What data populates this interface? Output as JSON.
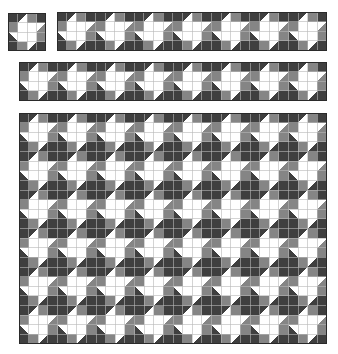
{
  "colors": {
    "dark": "#3f3f3f",
    "gray": "#858585",
    "white": "#ffffff",
    "line": "#b8b8b8",
    "border": "#2a2a2a"
  },
  "block": {
    "cells": [
      [
        "D",
        "T:D:W:tl",
        "G",
        "D"
      ],
      [
        "G",
        "W",
        "W",
        "T:W:G:tl"
      ],
      [
        "T:D:W:bl",
        "W",
        "W",
        "G"
      ],
      [
        "D",
        "G",
        "T:W:D:tl",
        "D"
      ]
    ]
  },
  "panels": [
    {
      "name": "single-block",
      "x": 8,
      "y": 13,
      "cols": 1,
      "rows": 1,
      "size": 38
    },
    {
      "name": "strip-top",
      "x": 57,
      "y": 12,
      "cols": 7,
      "rows": 1,
      "size": 38.6
    },
    {
      "name": "strip-middle",
      "x": 19,
      "y": 62,
      "cols": 8,
      "rows": 1,
      "size": 38.5
    },
    {
      "name": "quilt-grid",
      "x": 19,
      "y": 113,
      "cols": 8,
      "rows": 6,
      "size": 38.5
    }
  ]
}
